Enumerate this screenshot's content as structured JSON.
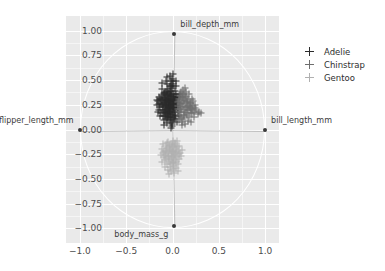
{
  "suptitle": "",
  "chart_data": {
    "type": "scatter",
    "title": "",
    "subtitle": "",
    "xlabel": "",
    "ylabel": "",
    "xlim": [
      -1.15,
      1.15
    ],
    "ylim": [
      -1.15,
      1.15
    ],
    "grid": true,
    "unit_circle": true,
    "xticks": [
      "-1.0",
      "-0.5",
      "0.0",
      "0.5",
      "1.0"
    ],
    "xtick_values": [
      -1.0,
      -0.5,
      0.0,
      0.5,
      1.0
    ],
    "yticks": [
      "1.00",
      "0.75",
      "0.50",
      "0.25",
      "0.00",
      "-0.25",
      "-0.50",
      "-0.75",
      "-1.00"
    ],
    "ytick_values": [
      1.0,
      0.75,
      0.5,
      0.25,
      0.0,
      -0.25,
      -0.5,
      -0.75,
      -1.0
    ],
    "legend": {
      "position": "right",
      "entries": [
        {
          "name": "Adelie",
          "color": "#2b2b2b"
        },
        {
          "name": "Chinstrap",
          "color": "#6e6e6e"
        },
        {
          "name": "Gentoo",
          "color": "#b0b0b0"
        }
      ]
    },
    "loadings": [
      {
        "label": "bill_depth_mm",
        "x": 0.02,
        "y": 0.97,
        "label_dx": 6,
        "label_dy": -9
      },
      {
        "label": "bill_length_mm",
        "x": 1.0,
        "y": -0.01,
        "label_dx": 6,
        "label_dy": -9
      },
      {
        "label": "flipper_length_mm",
        "x": -1.0,
        "y": -0.01,
        "label_dx": -6,
        "label_dy": -9
      },
      {
        "label": "body_mass_g",
        "x": 0.02,
        "y": -0.98,
        "label_dx": -6,
        "label_dy": 9
      }
    ],
    "series": [
      {
        "name": "Adelie",
        "color": "#2b2b2b",
        "points": [
          [
            -0.055,
            0.3
          ],
          [
            -0.04,
            0.285
          ],
          [
            -0.02,
            0.27
          ],
          [
            -0.075,
            0.245
          ],
          [
            0.0,
            0.32
          ],
          [
            -0.095,
            0.265
          ],
          [
            -0.03,
            0.235
          ],
          [
            -0.01,
            0.3
          ],
          [
            -0.06,
            0.205
          ],
          [
            -0.045,
            0.34
          ],
          [
            -0.025,
            0.18
          ],
          [
            0.01,
            0.255
          ],
          [
            -0.085,
            0.32
          ],
          [
            -0.05,
            0.16
          ],
          [
            -0.015,
            0.36
          ],
          [
            -0.07,
            0.29
          ],
          [
            -0.035,
            0.215
          ],
          [
            0.02,
            0.29
          ],
          [
            -0.1,
            0.23
          ],
          [
            -0.005,
            0.195
          ],
          [
            -0.065,
            0.375
          ],
          [
            -0.028,
            0.31
          ],
          [
            0.005,
            0.225
          ],
          [
            -0.08,
            0.18
          ],
          [
            -0.042,
            0.265
          ],
          [
            -0.018,
            0.34
          ],
          [
            -0.058,
            0.135
          ],
          [
            0.028,
            0.33
          ],
          [
            -0.11,
            0.3
          ],
          [
            -0.002,
            0.15
          ],
          [
            -0.048,
            0.415
          ],
          [
            -0.022,
            0.245
          ],
          [
            0.014,
            0.18
          ],
          [
            -0.09,
            0.355
          ],
          [
            -0.036,
            0.19
          ],
          [
            -0.012,
            0.395
          ],
          [
            -0.068,
            0.245
          ],
          [
            0.035,
            0.255
          ],
          [
            -0.125,
            0.265
          ],
          [
            -0.008,
            0.42
          ],
          [
            -0.052,
            0.115
          ],
          [
            -0.03,
            0.44
          ],
          [
            0.018,
            0.215
          ],
          [
            -0.105,
            0.195
          ],
          [
            -0.044,
            0.3
          ],
          [
            -0.016,
            0.13
          ],
          [
            -0.074,
            0.33
          ],
          [
            0.042,
            0.31
          ],
          [
            -0.132,
            0.225
          ],
          [
            0.0,
            0.1
          ],
          [
            -0.062,
            0.465
          ],
          [
            -0.026,
            0.175
          ],
          [
            0.008,
            0.36
          ],
          [
            -0.098,
            0.14
          ],
          [
            -0.038,
            0.245
          ],
          [
            -0.006,
            0.465
          ],
          [
            -0.078,
            0.2
          ],
          [
            0.05,
            0.23
          ],
          [
            -0.14,
            0.31
          ],
          [
            -0.014,
            0.08
          ],
          [
            -0.056,
            0.39
          ],
          [
            -0.032,
            0.125
          ],
          [
            0.024,
            0.39
          ],
          [
            -0.115,
            0.35
          ],
          [
            -0.046,
            0.17
          ],
          [
            -0.02,
            0.49
          ],
          [
            -0.086,
            0.275
          ],
          [
            0.032,
            0.15
          ],
          [
            -0.15,
            0.255
          ],
          [
            -0.004,
            0.51
          ],
          [
            -0.064,
            0.065
          ],
          [
            -0.034,
            0.215
          ],
          [
            0.002,
            0.28
          ],
          [
            -0.092,
            0.095
          ],
          [
            -0.04,
            0.355
          ],
          [
            -0.01,
            0.06
          ],
          [
            -0.07,
            0.155
          ],
          [
            0.046,
            0.27
          ],
          [
            -0.122,
            0.17
          ],
          [
            0.012,
            0.115
          ],
          [
            -0.054,
            0.53
          ],
          [
            -0.024,
            0.16
          ],
          [
            0.016,
            0.325
          ],
          [
            -0.108,
            0.415
          ],
          [
            -0.036,
            0.285
          ],
          [
            0.006,
            0.49
          ],
          [
            -0.082,
            0.24
          ],
          [
            0.054,
            0.195
          ],
          [
            -0.16,
            0.285
          ],
          [
            -0.002,
            0.04
          ],
          [
            -0.06,
            0.345
          ],
          [
            -0.028,
            0.095
          ],
          [
            0.038,
            0.355
          ],
          [
            -0.1,
            0.32
          ],
          [
            -0.044,
            0.13
          ],
          [
            -0.018,
            0.445
          ],
          [
            -0.076,
            0.365
          ],
          [
            0.026,
            0.105
          ],
          [
            -0.135,
            0.135
          ],
          [
            0.01,
            0.44
          ],
          [
            -0.066,
            0.18
          ],
          [
            -0.03,
            0.255
          ],
          [
            0.0,
            0.205
          ],
          [
            -0.088,
            0.175
          ],
          [
            -0.042,
            0.23
          ],
          [
            -0.012,
            0.34
          ],
          [
            -0.072,
            0.105
          ],
          [
            0.044,
            0.33
          ],
          [
            -0.118,
            0.245
          ],
          [
            0.004,
            0.165
          ],
          [
            -0.05,
            0.275
          ],
          [
            -0.026,
            0.385
          ],
          [
            0.02,
            0.24
          ],
          [
            -0.095,
            0.365
          ],
          [
            -0.038,
            0.305
          ],
          [
            -0.008,
            0.255
          ],
          [
            -0.08,
            0.3
          ],
          [
            0.03,
            0.21
          ],
          [
            -0.145,
            0.2
          ],
          [
            0.014,
            0.295
          ],
          [
            -0.058,
            0.23
          ],
          [
            -0.032,
            0.345
          ],
          [
            0.034,
            0.28
          ],
          [
            -0.102,
            0.255
          ],
          [
            -0.046,
            0.195
          ],
          [
            -0.016,
            0.215
          ],
          [
            -0.084,
            0.135
          ],
          [
            0.048,
            0.245
          ],
          [
            -0.128,
            0.305
          ],
          [
            0.022,
            0.135
          ],
          [
            0.06,
            0.305
          ],
          [
            0.068,
            0.265
          ],
          [
            0.056,
            0.175
          ],
          [
            0.074,
            0.33
          ],
          [
            0.064,
            0.215
          ],
          [
            -0.17,
            0.245
          ],
          [
            -0.155,
            0.18
          ],
          [
            -0.148,
            0.33
          ],
          [
            -0.162,
            0.295
          ],
          [
            0.0,
            0.56
          ],
          [
            -0.03,
            0.545
          ],
          [
            0.036,
            0.445
          ],
          [
            -0.112,
            0.47
          ],
          [
            0.08,
            0.36
          ],
          [
            -0.02,
            0.015
          ],
          [
            0.052,
            0.075
          ],
          [
            -0.09,
            0.045
          ],
          [
            0.07,
            0.14
          ],
          [
            -0.066,
            0.495
          ],
          [
            0.04,
            0.495
          ]
        ]
      },
      {
        "name": "Chinstrap",
        "color": "#6e6e6e",
        "points": [
          [
            0.09,
            0.255
          ],
          [
            0.105,
            0.225
          ],
          [
            0.075,
            0.29
          ],
          [
            0.12,
            0.2
          ],
          [
            0.06,
            0.235
          ],
          [
            0.135,
            0.265
          ],
          [
            0.095,
            0.175
          ],
          [
            0.11,
            0.32
          ],
          [
            0.08,
            0.145
          ],
          [
            0.145,
            0.23
          ],
          [
            0.065,
            0.31
          ],
          [
            0.125,
            0.15
          ],
          [
            0.1,
            0.36
          ],
          [
            0.155,
            0.285
          ],
          [
            0.085,
            0.205
          ],
          [
            0.115,
            0.105
          ],
          [
            0.07,
            0.175
          ],
          [
            0.165,
            0.195
          ],
          [
            0.13,
            0.335
          ],
          [
            0.09,
            0.12
          ],
          [
            0.175,
            0.25
          ],
          [
            0.105,
            0.075
          ],
          [
            0.14,
            0.18
          ],
          [
            0.055,
            0.275
          ],
          [
            0.185,
            0.225
          ],
          [
            0.12,
            0.29
          ],
          [
            0.16,
            0.145
          ],
          [
            0.078,
            0.34
          ],
          [
            0.195,
            0.17
          ],
          [
            0.108,
            0.405
          ],
          [
            0.15,
            0.325
          ],
          [
            0.068,
            0.095
          ],
          [
            0.205,
            0.265
          ],
          [
            0.132,
            0.06
          ],
          [
            0.172,
            0.31
          ],
          [
            0.092,
            0.38
          ],
          [
            0.215,
            0.205
          ],
          [
            0.118,
            0.24
          ],
          [
            0.182,
            0.13
          ],
          [
            0.058,
            0.205
          ],
          [
            0.225,
            0.24
          ],
          [
            0.142,
            0.375
          ],
          [
            0.192,
            0.27
          ],
          [
            0.102,
            0.045
          ],
          [
            0.235,
            0.18
          ],
          [
            0.128,
            0.13
          ],
          [
            0.202,
            0.22
          ],
          [
            0.082,
            0.255
          ],
          [
            0.245,
            0.215
          ],
          [
            0.155,
            0.215
          ],
          [
            0.212,
            0.165
          ],
          [
            0.112,
            0.3
          ],
          [
            0.258,
            0.195
          ],
          [
            0.168,
            0.09
          ],
          [
            0.222,
            0.29
          ],
          [
            0.138,
            0.42
          ],
          [
            0.272,
            0.155
          ],
          [
            0.098,
            0.33
          ],
          [
            0.232,
            0.13
          ],
          [
            0.178,
            0.355
          ],
          [
            0.148,
            0.165
          ],
          [
            0.288,
            0.18
          ],
          [
            0.188,
            0.195
          ],
          [
            0.122,
            0.355
          ],
          [
            0.242,
            0.245
          ],
          [
            0.158,
            0.28
          ],
          [
            0.198,
            0.08
          ],
          [
            0.305,
            0.165
          ],
          [
            0.208,
            0.305
          ],
          [
            0.168,
            0.24
          ]
        ]
      },
      {
        "name": "Gentoo",
        "color": "#b0b0b0",
        "points": [
          [
            -0.02,
            -0.25
          ],
          [
            -0.005,
            -0.23
          ],
          [
            -0.035,
            -0.265
          ],
          [
            0.01,
            -0.215
          ],
          [
            -0.05,
            -0.24
          ],
          [
            0.0,
            -0.285
          ],
          [
            -0.025,
            -0.195
          ],
          [
            0.025,
            -0.255
          ],
          [
            -0.065,
            -0.225
          ],
          [
            -0.012,
            -0.31
          ],
          [
            0.015,
            -0.18
          ],
          [
            -0.042,
            -0.3
          ],
          [
            0.035,
            -0.23
          ],
          [
            -0.08,
            -0.255
          ],
          [
            -0.002,
            -0.17
          ],
          [
            0.005,
            -0.335
          ],
          [
            -0.03,
            -0.16
          ],
          [
            0.045,
            -0.275
          ],
          [
            -0.055,
            -0.185
          ],
          [
            -0.018,
            -0.35
          ],
          [
            0.022,
            -0.305
          ],
          [
            -0.07,
            -0.29
          ],
          [
            0.055,
            -0.215
          ],
          [
            -0.008,
            -0.145
          ],
          [
            -0.038,
            -0.33
          ],
          [
            0.03,
            -0.155
          ],
          [
            -0.088,
            -0.22
          ],
          [
            0.012,
            -0.37
          ],
          [
            -0.06,
            -0.135
          ],
          [
            0.042,
            -0.33
          ],
          [
            -0.022,
            -0.205
          ],
          [
            0.065,
            -0.25
          ],
          [
            -0.095,
            -0.275
          ],
          [
            0.0,
            -0.4
          ],
          [
            -0.045,
            -0.125
          ],
          [
            0.018,
            -0.265
          ],
          [
            -0.075,
            -0.17
          ],
          [
            0.052,
            -0.18
          ],
          [
            -0.028,
            -0.385
          ],
          [
            0.072,
            -0.3
          ],
          [
            -0.105,
            -0.24
          ],
          [
            0.008,
            -0.12
          ],
          [
            -0.058,
            -0.345
          ],
          [
            0.038,
            -0.2
          ],
          [
            -0.015,
            -0.42
          ],
          [
            0.082,
            -0.235
          ],
          [
            -0.085,
            -0.31
          ],
          [
            0.028,
            -0.14
          ],
          [
            -0.048,
            -0.27
          ],
          [
            0.062,
            -0.35
          ],
          [
            -0.115,
            -0.195
          ],
          [
            -0.005,
            -0.215
          ],
          [
            0.048,
            -0.12
          ],
          [
            -0.068,
            -0.215
          ],
          [
            0.018,
            -0.44
          ],
          [
            -0.035,
            -0.18
          ],
          [
            0.092,
            -0.27
          ],
          [
            -0.098,
            -0.15
          ],
          [
            0.002,
            -0.33
          ],
          [
            -0.052,
            -0.41
          ],
          [
            0.035,
            -0.39
          ],
          [
            -0.128,
            -0.255
          ],
          [
            0.07,
            -0.165
          ],
          [
            -0.078,
            -0.375
          ],
          [
            -0.01,
            -0.275
          ],
          [
            0.058,
            -0.42
          ],
          [
            -0.04,
            -0.455
          ],
          [
            0.1,
            -0.205
          ],
          [
            -0.108,
            -0.33
          ],
          [
            0.024,
            -0.235
          ]
        ]
      }
    ]
  }
}
